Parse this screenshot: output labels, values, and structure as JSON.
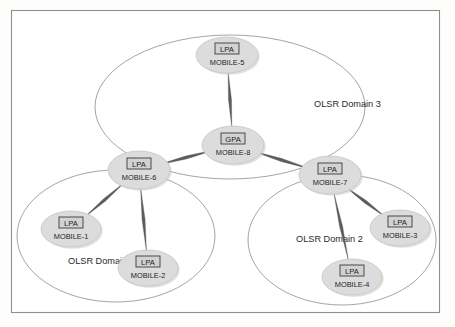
{
  "figure": {
    "kind": "network-topology-diagram",
    "background_color": "#fdfdfc",
    "frame_color": "#8e8e8e",
    "node_fill_color": "#dcdcdc",
    "node_box_fill_color": "#d2d2d2",
    "link_color": "#5d5d5d",
    "domain_outline_color": "#9a9a9a"
  },
  "domains": [
    {
      "id": "domain-1",
      "label": "OLSR Domain 1",
      "label_x": 68,
      "label_y": 264,
      "cx": 116,
      "cy": 236,
      "rx": 99,
      "ry": 66
    },
    {
      "id": "domain-2",
      "label": "OLSR Domain 2",
      "label_x": 296,
      "label_y": 242,
      "cx": 342,
      "cy": 240,
      "rx": 94,
      "ry": 65
    },
    {
      "id": "domain-3",
      "label": "OLSR Domain 3",
      "label_x": 314,
      "label_y": 107,
      "cx": 230,
      "cy": 107,
      "rx": 135,
      "ry": 72
    }
  ],
  "nodes": [
    {
      "id": "mobile-1",
      "type": "LPA",
      "name": "MOBILE-1",
      "cx": 71,
      "cy": 229,
      "rx": 30,
      "ry": 18
    },
    {
      "id": "mobile-2",
      "type": "LPA",
      "name": "MOBILE-2",
      "cx": 148,
      "cy": 268,
      "rx": 30,
      "ry": 18
    },
    {
      "id": "mobile-3",
      "type": "LPA",
      "name": "MOBILE-3",
      "cx": 400,
      "cy": 228,
      "rx": 30,
      "ry": 18
    },
    {
      "id": "mobile-4",
      "type": "LPA",
      "name": "MOBILE-4",
      "cx": 352,
      "cy": 277,
      "rx": 30,
      "ry": 18
    },
    {
      "id": "mobile-5",
      "type": "LPA",
      "name": "MOBILE-5",
      "cx": 227,
      "cy": 55,
      "rx": 31,
      "ry": 18
    },
    {
      "id": "mobile-6",
      "type": "LPA",
      "name": "MOBILE-6",
      "cx": 139,
      "cy": 170,
      "rx": 31,
      "ry": 19
    },
    {
      "id": "mobile-7",
      "type": "LPA",
      "name": "MOBILE-7",
      "cx": 330,
      "cy": 175,
      "rx": 31,
      "ry": 19
    },
    {
      "id": "mobile-8",
      "type": "GPA",
      "name": "MOBILE-8",
      "cx": 233,
      "cy": 145,
      "rx": 31,
      "ry": 19
    }
  ],
  "links": [
    {
      "id": "link-5-8",
      "from": "mobile-5",
      "to": "mobile-8"
    },
    {
      "id": "link-8-6",
      "from": "mobile-8",
      "to": "mobile-6"
    },
    {
      "id": "link-8-7",
      "from": "mobile-8",
      "to": "mobile-7"
    },
    {
      "id": "link-6-1",
      "from": "mobile-6",
      "to": "mobile-1"
    },
    {
      "id": "link-6-2",
      "from": "mobile-6",
      "to": "mobile-2"
    },
    {
      "id": "link-7-3",
      "from": "mobile-7",
      "to": "mobile-3"
    },
    {
      "id": "link-7-4",
      "from": "mobile-7",
      "to": "mobile-4"
    }
  ]
}
